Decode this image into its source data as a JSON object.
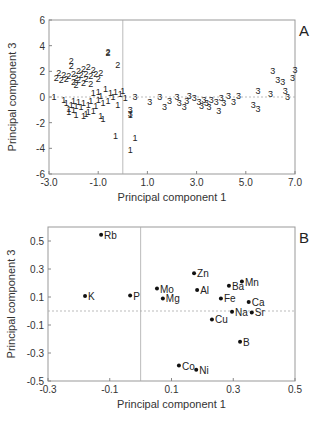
{
  "chart_data": [
    {
      "type": "scatter",
      "panel_label": "A",
      "title": "",
      "xlabel": "Principal component 1",
      "ylabel": "Principal component 3",
      "xlim": [
        -3.0,
        7.0
      ],
      "ylim": [
        -6,
        6
      ],
      "xticks": [
        "-3.0",
        "-1.0",
        "1.0",
        "3.0",
        "5.0",
        "7.0"
      ],
      "yticks": [
        "-6",
        "-4",
        "-2",
        "0",
        "2",
        "4",
        "6"
      ],
      "reference_lines": {
        "x": 0,
        "y": 0,
        "style": "dotted"
      },
      "grid": false,
      "legend": null,
      "marker_style": "group number as text label",
      "series": [
        {
          "name": "1",
          "points": [
            [
              -2.8,
              0.0
            ],
            [
              -2.4,
              -0.2
            ],
            [
              -2.3,
              -0.5
            ],
            [
              -2.2,
              -0.9
            ],
            [
              -2.2,
              -1.2
            ],
            [
              -2.1,
              -0.6
            ],
            [
              -2.0,
              -1.0
            ],
            [
              -2.0,
              -0.3
            ],
            [
              -1.9,
              -1.4
            ],
            [
              -1.9,
              -0.7
            ],
            [
              -1.8,
              -0.4
            ],
            [
              -1.7,
              -0.8
            ],
            [
              -1.6,
              -0.5
            ],
            [
              -1.5,
              -1.3
            ],
            [
              -1.4,
              -1.2
            ],
            [
              -1.4,
              -0.6
            ],
            [
              -1.3,
              -0.3
            ],
            [
              -1.2,
              -1.1
            ],
            [
              -1.2,
              0.3
            ],
            [
              -1.1,
              -0.7
            ],
            [
              -1.0,
              -0.2
            ],
            [
              -1.0,
              0.4
            ],
            [
              -0.9,
              -1.5
            ],
            [
              -0.9,
              0.1
            ],
            [
              -0.8,
              -0.5
            ],
            [
              -0.7,
              0.6
            ],
            [
              -0.6,
              -0.3
            ],
            [
              -0.5,
              0.3
            ],
            [
              -0.4,
              0.0
            ],
            [
              -0.3,
              0.4
            ],
            [
              -0.2,
              -0.6
            ],
            [
              -0.1,
              0.2
            ],
            [
              0.0,
              0.5
            ],
            [
              0.1,
              -0.1
            ],
            [
              0.3,
              -1.4
            ],
            [
              -0.8,
              -1.7
            ],
            [
              -0.3,
              -3.0
            ],
            [
              0.5,
              -3.2
            ],
            [
              0.3,
              -4.1
            ],
            [
              -1.6,
              -1.5
            ]
          ]
        },
        {
          "name": "2",
          "points": [
            [
              -2.7,
              1.5
            ],
            [
              -2.6,
              1.9
            ],
            [
              -2.5,
              1.3
            ],
            [
              -2.4,
              1.7
            ],
            [
              -2.3,
              1.4
            ],
            [
              -2.2,
              1.6
            ],
            [
              -2.1,
              2.8
            ],
            [
              -2.1,
              2.4
            ],
            [
              -2.0,
              1.2
            ],
            [
              -2.0,
              1.8
            ],
            [
              -1.9,
              0.9
            ],
            [
              -1.9,
              1.5
            ],
            [
              -1.8,
              2.0
            ],
            [
              -1.8,
              1.3
            ],
            [
              -1.7,
              1.7
            ],
            [
              -1.6,
              2.2
            ],
            [
              -1.6,
              1.1
            ],
            [
              -1.5,
              1.8
            ],
            [
              -1.5,
              1.4
            ],
            [
              -1.4,
              2.3
            ],
            [
              -1.3,
              1.6
            ],
            [
              -1.3,
              1.0
            ],
            [
              -1.2,
              2.1
            ],
            [
              -1.1,
              1.8
            ],
            [
              -1.0,
              1.4
            ],
            [
              -0.9,
              1.9
            ],
            [
              -0.6,
              3.5
            ],
            [
              -0.6,
              3.4
            ],
            [
              -0.2,
              2.5
            ]
          ]
        },
        {
          "name": "3",
          "points": [
            [
              0.3,
              -1.0
            ],
            [
              0.3,
              -1.3
            ],
            [
              0.5,
              0.0
            ],
            [
              1.1,
              -0.4
            ],
            [
              1.5,
              0.0
            ],
            [
              1.7,
              -0.8
            ],
            [
              1.9,
              -0.3
            ],
            [
              2.2,
              0.0
            ],
            [
              2.3,
              -0.5
            ],
            [
              2.5,
              -0.8
            ],
            [
              2.6,
              -0.3
            ],
            [
              2.7,
              0.1
            ],
            [
              2.9,
              -0.1
            ],
            [
              3.1,
              -0.4
            ],
            [
              3.2,
              -0.7
            ],
            [
              3.3,
              -0.2
            ],
            [
              3.4,
              -0.5
            ],
            [
              3.5,
              -0.8
            ],
            [
              3.6,
              -0.2
            ],
            [
              3.8,
              -0.4
            ],
            [
              3.9,
              -1.1
            ],
            [
              4.0,
              -0.1
            ],
            [
              4.1,
              -0.5
            ],
            [
              4.3,
              0.1
            ],
            [
              4.5,
              -0.4
            ],
            [
              4.7,
              0.1
            ],
            [
              5.3,
              -0.6
            ],
            [
              5.5,
              0.5
            ],
            [
              5.5,
              -0.9
            ],
            [
              6.0,
              0.2
            ],
            [
              6.1,
              2.0
            ],
            [
              6.3,
              1.3
            ],
            [
              6.5,
              1.2
            ],
            [
              6.6,
              0.5
            ],
            [
              6.7,
              0.0
            ],
            [
              6.9,
              1.5
            ],
            [
              7.0,
              2.1
            ]
          ]
        }
      ]
    },
    {
      "type": "scatter",
      "panel_label": "B",
      "title": "",
      "xlabel": "Principal component 1",
      "ylabel": "Principal component 3",
      "xlim": [
        -0.3,
        0.5
      ],
      "ylim": [
        -0.5,
        0.6
      ],
      "xticks": [
        "-0.3",
        "-0.1",
        "0.1",
        "0.3",
        "0.5"
      ],
      "yticks": [
        "-0.5",
        "-0.3",
        "-0.1",
        "0.1",
        "0.3",
        "0.5"
      ],
      "reference_lines": {
        "x": 0,
        "y": 0,
        "style": "dotted"
      },
      "grid": false,
      "legend": null,
      "points": [
        {
          "label": "Rb",
          "x": -0.128,
          "y": 0.544
        },
        {
          "label": "K",
          "x": -0.18,
          "y": 0.107
        },
        {
          "label": "P",
          "x": -0.034,
          "y": 0.11
        },
        {
          "label": "Mo",
          "x": 0.053,
          "y": 0.16
        },
        {
          "label": "Mg",
          "x": 0.072,
          "y": 0.09
        },
        {
          "label": "Zn",
          "x": 0.173,
          "y": 0.27
        },
        {
          "label": "Al",
          "x": 0.183,
          "y": 0.15
        },
        {
          "label": "Ba",
          "x": 0.286,
          "y": 0.18
        },
        {
          "label": "Mn",
          "x": 0.328,
          "y": 0.21
        },
        {
          "label": "Fe",
          "x": 0.26,
          "y": 0.09
        },
        {
          "label": "Ca",
          "x": 0.35,
          "y": 0.065
        },
        {
          "label": "Na",
          "x": 0.296,
          "y": -0.005
        },
        {
          "label": "Sr",
          "x": 0.36,
          "y": -0.01
        },
        {
          "label": "Cu",
          "x": 0.231,
          "y": -0.06
        },
        {
          "label": "B",
          "x": 0.322,
          "y": -0.22
        },
        {
          "label": "Co",
          "x": 0.124,
          "y": -0.39
        },
        {
          "label": "Ni",
          "x": 0.18,
          "y": -0.42
        }
      ]
    }
  ]
}
